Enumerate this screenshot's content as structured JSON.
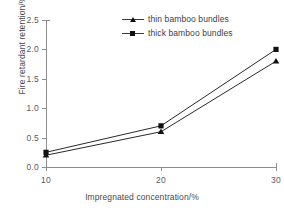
{
  "chart_data": {
    "type": "line",
    "title": "",
    "xlabel": "Impregnated concentration/%",
    "ylabel": "Fire retardant retention/%",
    "x": [
      10,
      20,
      30
    ],
    "xticklabels": [
      "10",
      "20",
      "30"
    ],
    "yticklabels": [
      "0.0",
      "0.5",
      "1.0",
      "1.5",
      "2.0",
      "2.5"
    ],
    "xlim": [
      10,
      30
    ],
    "ylim": [
      0.0,
      2.5
    ],
    "grid": false,
    "legend_position": "top-center-inside",
    "series": [
      {
        "name": "thin bamboo bundles",
        "marker": "triangle",
        "color": "#111111",
        "values": [
          0.2,
          0.6,
          1.8
        ]
      },
      {
        "name": "thick bamboo bundles",
        "marker": "square",
        "color": "#111111",
        "values": [
          0.25,
          0.7,
          2.0
        ]
      }
    ]
  },
  "axes": {
    "y_ticks": [
      {
        "label": "2.5",
        "value": 2.5
      },
      {
        "label": "2.0",
        "value": 2.0
      },
      {
        "label": "1.5",
        "value": 1.5
      },
      {
        "label": "1.0",
        "value": 1.0
      },
      {
        "label": "0.5",
        "value": 0.5
      },
      {
        "label": "0.0",
        "value": 0.0
      }
    ],
    "x_ticks": [
      {
        "label": "10",
        "value": 10
      },
      {
        "label": "20",
        "value": 20
      },
      {
        "label": "30",
        "value": 30
      }
    ],
    "axis_color": "#8d8d8d",
    "tick_text_color": "#5a5a5a",
    "title_color": "#4a4a4a"
  },
  "legend": {
    "entries": [
      {
        "label": "thin bamboo bundles",
        "marker": "triangle"
      },
      {
        "label": "thick bamboo bundles",
        "marker": "square"
      }
    ]
  }
}
